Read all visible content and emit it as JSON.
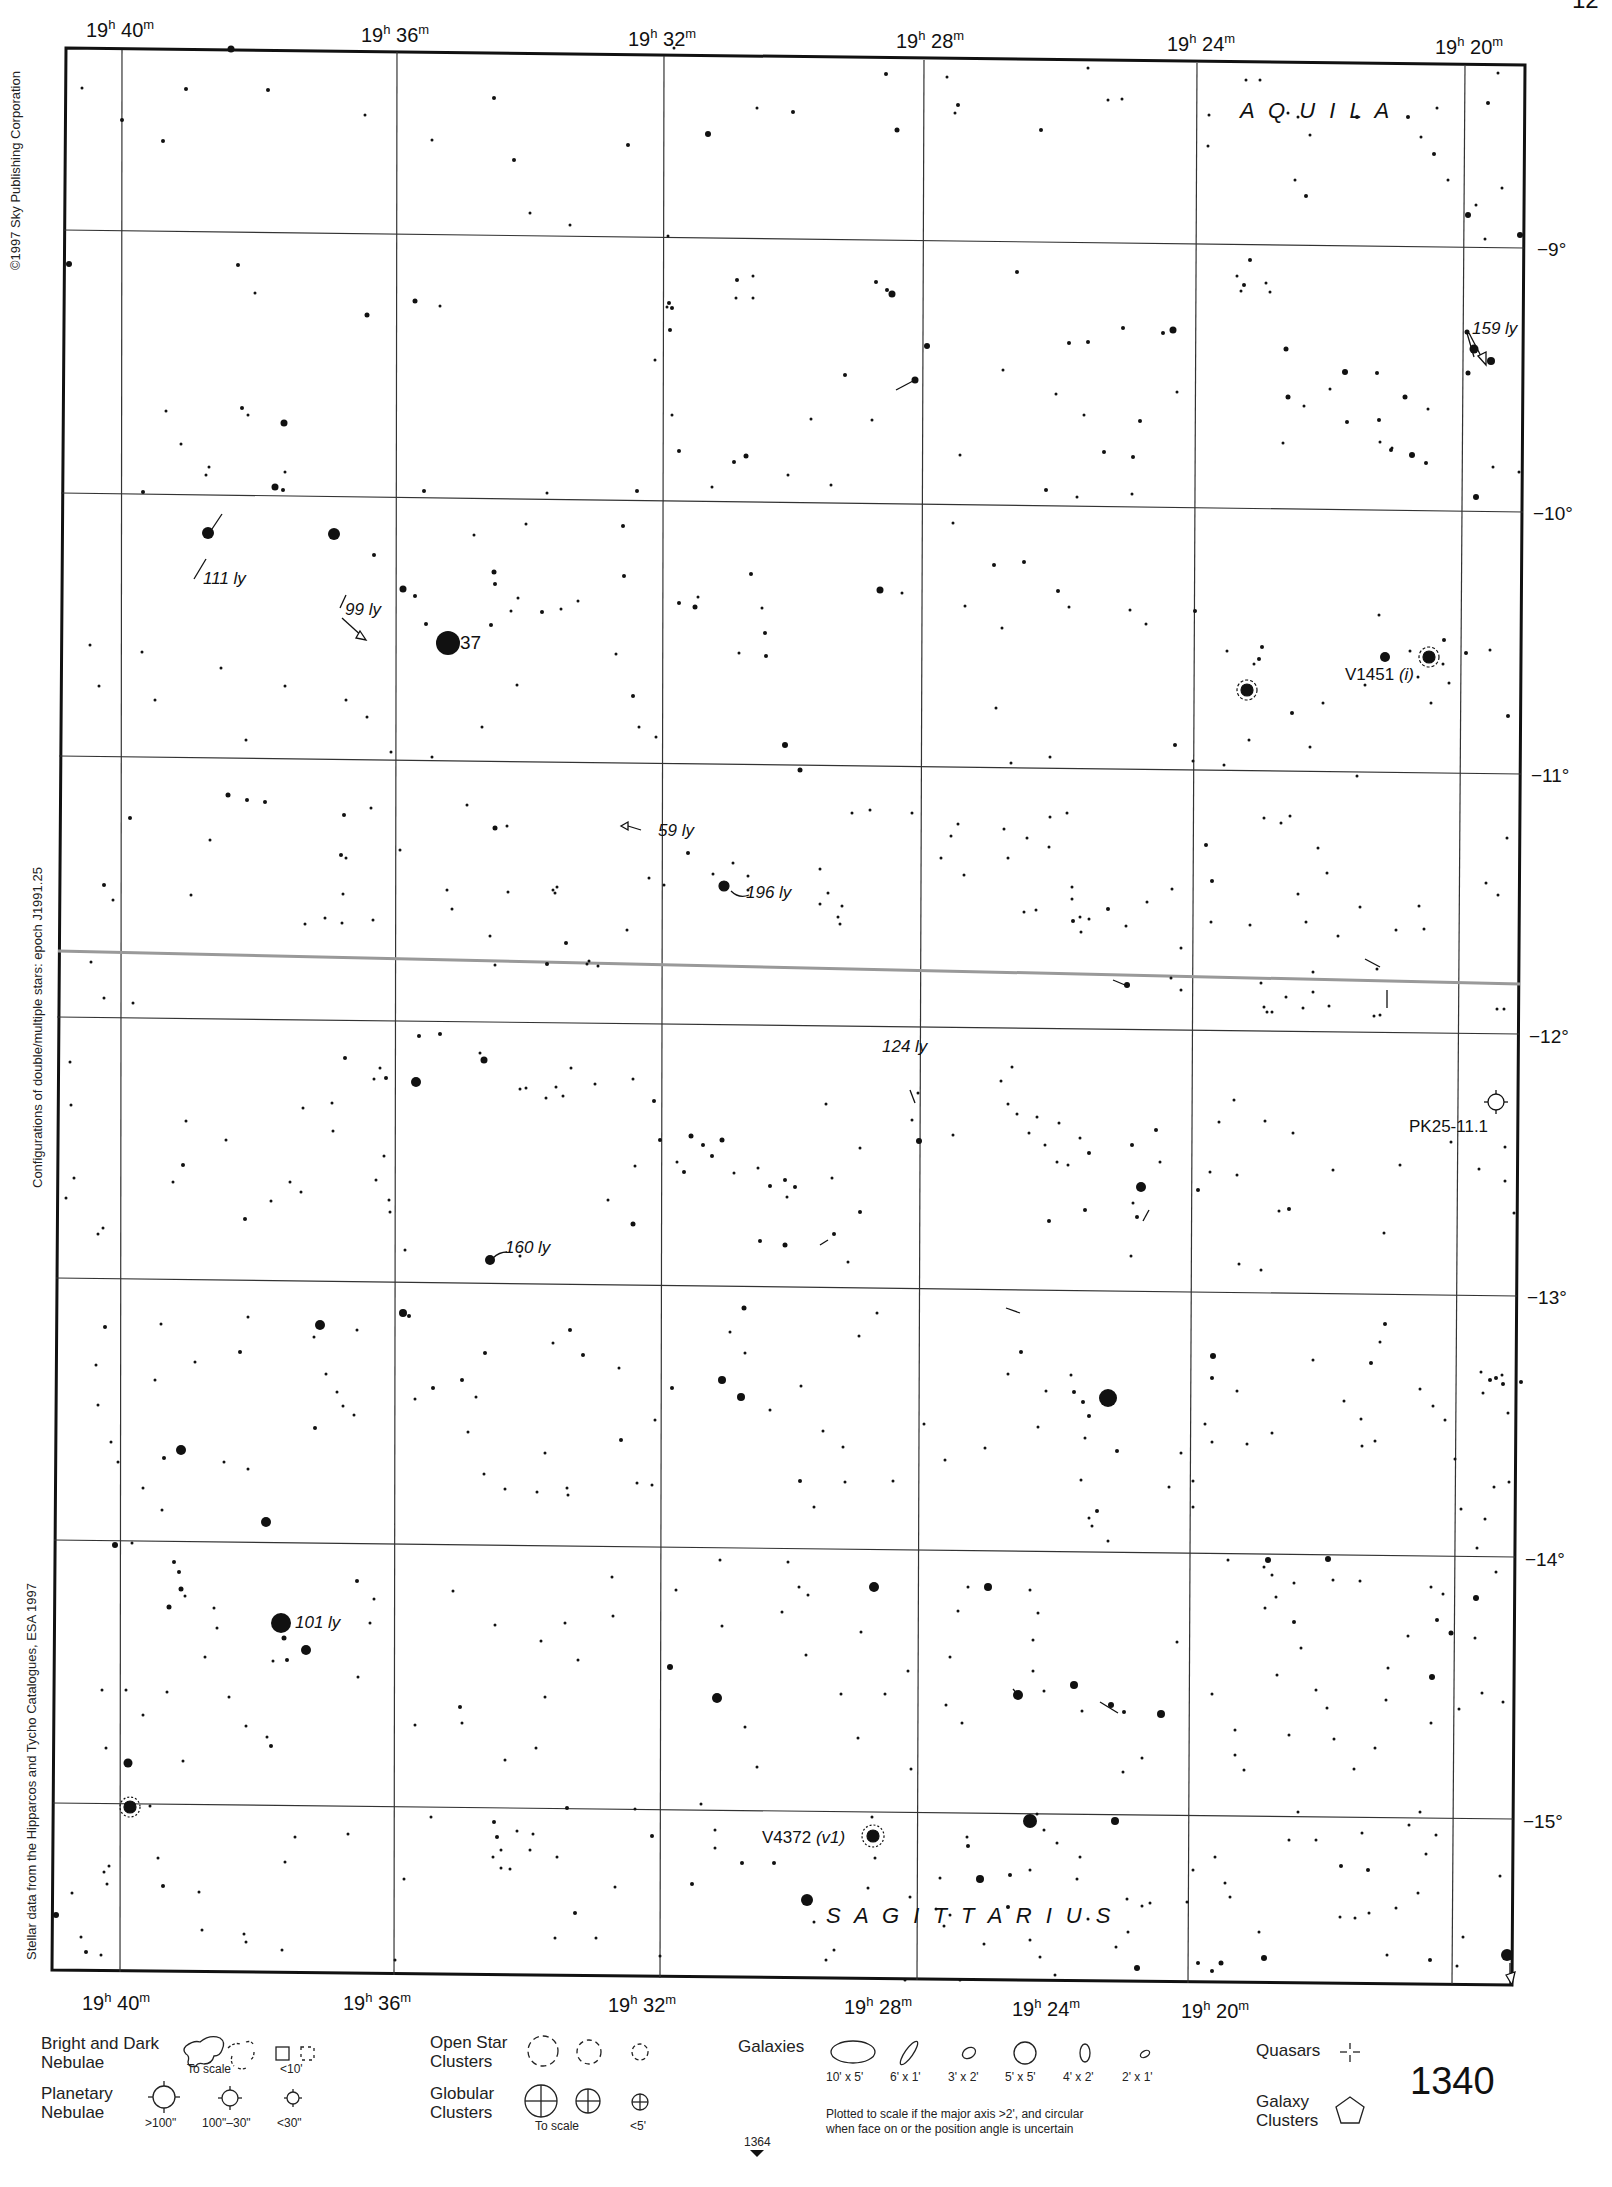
{
  "chart": {
    "corner_mark": "12",
    "page_number": "1340",
    "prev_page_ref": "1364",
    "ra_labels_top": [
      "19h 40m",
      "19h 36m",
      "19h 32m",
      "19h 28m",
      "19h 24m",
      "19h 20m"
    ],
    "ra_labels": [
      {
        "h": "19",
        "m": "40"
      },
      {
        "h": "19",
        "m": "36"
      },
      {
        "h": "19",
        "m": "32"
      },
      {
        "h": "19",
        "m": "28"
      },
      {
        "h": "19",
        "m": "24"
      },
      {
        "h": "19",
        "m": "20"
      }
    ],
    "dec_labels": [
      "−9°",
      "−10°",
      "−11°",
      "−12°",
      "−13°",
      "−14°",
      "−15°"
    ],
    "side_notes": {
      "copyright": "©1997 Sky Publishing Corporation",
      "epoch": "Configurations of double/multiple stars: epoch J1991.25",
      "source": "Stellar data from the Hipparcos and Tycho Catalogues, ESA 1997"
    },
    "constellations": [
      {
        "name": "A Q U I L A"
      },
      {
        "name": "S A G I T T A R I U S"
      }
    ],
    "labels": {
      "star37": "37",
      "ly111": "111 ly",
      "ly99": "99 ly",
      "ly159": "159 ly",
      "ly59": "59 ly",
      "ly196": "196 ly",
      "ly124": "124 ly",
      "ly160": "160 ly",
      "ly101": "101 ly",
      "v1451": "V1451",
      "v1451_tag": "(i)",
      "pk": "PK25-11.1",
      "v4372": "V4372",
      "v4372_tag": "(v1)"
    }
  },
  "legend": {
    "nebulae_title": "Bright and Dark\nNebulae",
    "nebulae_title_1": "Bright and Dark",
    "nebulae_title_2": "Nebulae",
    "nebulae_to_scale": "To scale",
    "nebulae_small": "<10'",
    "planetary_1": "Planetary",
    "planetary_2": "Nebulae",
    "planetary_sizes": [
      ">100\"",
      "100\"–30\"",
      "<30\""
    ],
    "open_1": "Open Star",
    "open_2": "Clusters",
    "globular_1": "Globular",
    "globular_2": "Clusters",
    "globular_to_scale": "To scale",
    "globular_small": "<5'",
    "galaxies": "Galaxies",
    "galaxy_sizes": [
      "10' x 5'",
      "6' x 1'",
      "3' x 2'",
      "5' x 5'",
      "4' x 2'",
      "2' x 1'"
    ],
    "galaxy_note_1": "Plotted to scale if the major axis >2', and circular",
    "galaxy_note_2": "when face on or the position angle is uncertain",
    "quasars": "Quasars",
    "clusters_1": "Galaxy",
    "clusters_2": "Clusters"
  }
}
